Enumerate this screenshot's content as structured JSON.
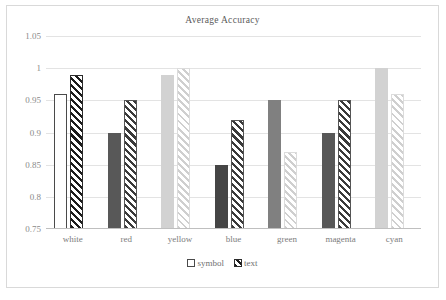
{
  "chart_data": {
    "type": "bar",
    "title": "Average Accuracy",
    "xlabel": "",
    "ylabel": "",
    "ylim": [
      0.75,
      1.05
    ],
    "ytick_values": [
      1.05,
      1,
      0.95,
      0.9,
      0.85,
      0.8,
      0.75
    ],
    "ytick_labels": [
      "1.05",
      "1",
      "0.95",
      "0.9",
      "0.85",
      "0.8",
      "0.75"
    ],
    "grid": true,
    "legend_position": "bottom",
    "categories": [
      "white",
      "red",
      "yellow",
      "blue",
      "green",
      "magenta",
      "cyan"
    ],
    "series": [
      {
        "name": "symbol",
        "values": [
          0.96,
          0.9,
          0.99,
          0.85,
          0.95,
          0.9,
          1.0
        ],
        "styles": [
          "fill-white",
          "fill-dark",
          "fill-light",
          "fill-vdark",
          "fill-mid",
          "fill-dark",
          "fill-light"
        ]
      },
      {
        "name": "text",
        "values": [
          0.99,
          0.95,
          1.0,
          0.92,
          0.87,
          0.95,
          0.96
        ],
        "styles": [
          "hatch-black",
          "hatch-dark",
          "hatch-light",
          "hatch-dark",
          "hatch-light",
          "hatch-dark",
          "hatch-light"
        ]
      }
    ]
  },
  "legend": {
    "items": [
      {
        "label": "symbol",
        "marker": "open-square-marker"
      },
      {
        "label": "text",
        "marker": "hatched-square-marker"
      }
    ]
  },
  "colors": {
    "grid": "#e3e3e3",
    "axis": "#bfbfbf",
    "text": "#7c7c7c",
    "title": "#5a5a5a",
    "border": "#d9d9d9"
  }
}
